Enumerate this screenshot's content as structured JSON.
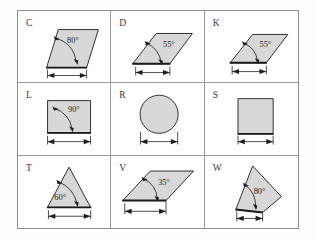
{
  "page": {
    "background_color": "#fdfdfc",
    "border_color": "#8d8d8d",
    "grid_line_color": "#9a9a9a",
    "shape_fill_color": "#d8d8d8",
    "shape_outline_color": "#2e2e2e",
    "label_color": "#3a3a3a"
  },
  "grid": {
    "rows": 3,
    "columns": 3
  },
  "cells": [
    {
      "code": "C",
      "shape": "parallelogram-steep",
      "angle_label": "80°",
      "has_dimension_arrow": true,
      "row": 1,
      "column": 1
    },
    {
      "code": "D",
      "shape": "parallelogram-oblique",
      "angle_label": "55°",
      "has_dimension_arrow": true,
      "row": 1,
      "column": 2
    },
    {
      "code": "K",
      "shape": "parallelogram-oblique",
      "angle_label": "55°",
      "has_dimension_arrow": true,
      "row": 1,
      "column": 3
    },
    {
      "code": "L",
      "shape": "rectangle",
      "angle_label": "90°",
      "has_dimension_arrow": true,
      "row": 2,
      "column": 1
    },
    {
      "code": "R",
      "shape": "circle",
      "angle_label": "",
      "has_dimension_arrow": true,
      "row": 2,
      "column": 2
    },
    {
      "code": "S",
      "shape": "square",
      "angle_label": "",
      "has_dimension_arrow": true,
      "row": 2,
      "column": 3
    },
    {
      "code": "T",
      "shape": "triangle-equilateral",
      "angle_label": "60°",
      "has_dimension_arrow": true,
      "row": 3,
      "column": 1
    },
    {
      "code": "V",
      "shape": "parallelogram-flat",
      "angle_label": "35°",
      "has_dimension_arrow": true,
      "row": 3,
      "column": 2
    },
    {
      "code": "W",
      "shape": "quadrilateral-irregular",
      "angle_label": "80°",
      "has_dimension_arrow": true,
      "row": 3,
      "column": 3
    }
  ]
}
